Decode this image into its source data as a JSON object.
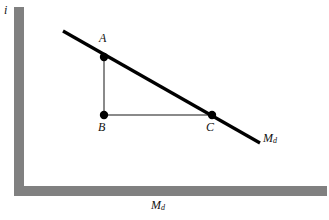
{
  "figure": {
    "type": "economics-money-demand-diagram",
    "background_color": "#ffffff",
    "axis_color": "#808080",
    "curve_color": "#000000",
    "guide_color": "#808080",
    "point_color": "#000000",
    "text_color": "#111111",
    "width": 329,
    "height": 220
  },
  "axes": {
    "y_label": "i",
    "x_label_main": "M",
    "x_label_sub": "d",
    "y_axis": {
      "x": 19,
      "y_top": 7,
      "y_bottom": 191,
      "thickness": 10
    },
    "x_axis": {
      "y": 191,
      "x_left": 14,
      "x_right": 327,
      "thickness": 10
    }
  },
  "curve": {
    "name": "money-demand-curve",
    "label_main": "M",
    "label_sub": "d",
    "start": {
      "x": 63,
      "y": 31
    },
    "end": {
      "x": 260,
      "y": 143
    },
    "stroke_width": 3.2
  },
  "points": [
    {
      "id": "A",
      "label": "A",
      "x": 104,
      "y": 57,
      "radius": 4.2,
      "label_position": "above"
    },
    {
      "id": "B",
      "label": "B",
      "x": 104,
      "y": 115,
      "radius": 4.2,
      "label_position": "below"
    },
    {
      "id": "C",
      "label": "C",
      "x": 212,
      "y": 115,
      "radius": 4.2,
      "label_position": "below"
    }
  ],
  "guides": [
    {
      "name": "vertical-guide-A-B",
      "x1": 104,
      "y1": 57,
      "x2": 104,
      "y2": 115
    },
    {
      "name": "horizontal-guide-B-C",
      "x1": 104,
      "y1": 115,
      "x2": 212,
      "y2": 115
    }
  ]
}
